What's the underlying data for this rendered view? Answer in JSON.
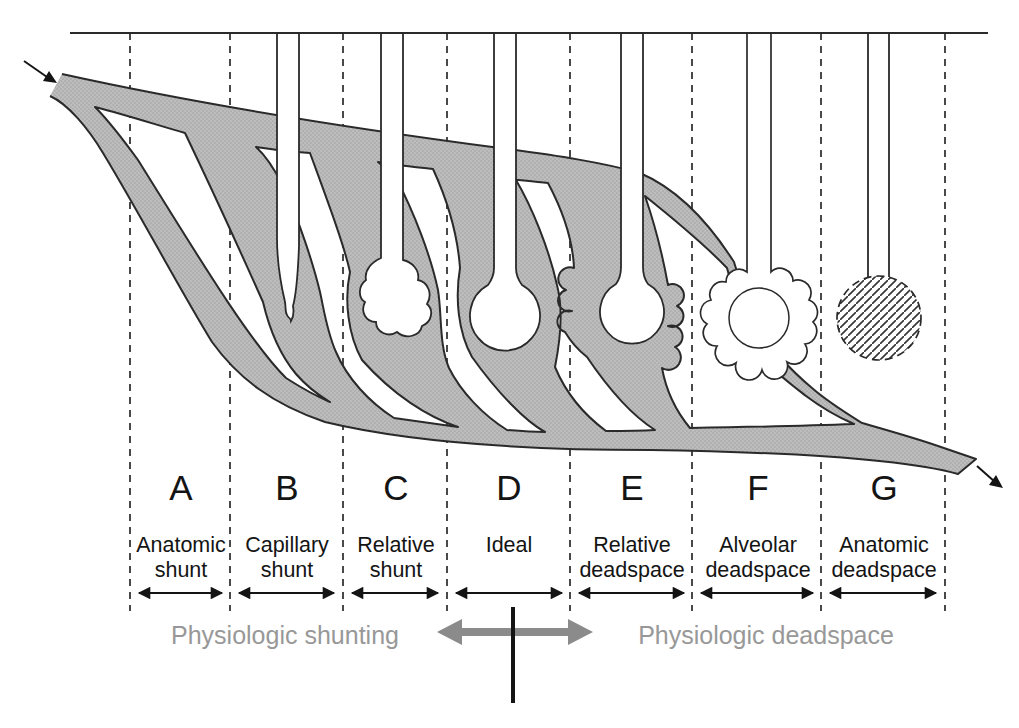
{
  "figure": {
    "title_hint": "ventilation-perfusion spectrum diagram",
    "zones": [
      {
        "letter": "A",
        "label_line1": "Anatomic",
        "label_line2": "shunt"
      },
      {
        "letter": "B",
        "label_line1": "Capillary",
        "label_line2": "shunt"
      },
      {
        "letter": "C",
        "label_line1": "Relative",
        "label_line2": "shunt"
      },
      {
        "letter": "D",
        "label_line1": "Ideal",
        "label_line2": ""
      },
      {
        "letter": "E",
        "label_line1": "Relative",
        "label_line2": "deadspace"
      },
      {
        "letter": "F",
        "label_line1": "Alveolar",
        "label_line2": "deadspace"
      },
      {
        "letter": "G",
        "label_line1": "Anatomic",
        "label_line2": "deadspace"
      }
    ],
    "group_labels": {
      "left": "Physiologic shunting",
      "right": "Physiologic deadspace"
    },
    "colors": {
      "vessel_fill": "#bdbdbd",
      "vessel_dot": "#a4a4a4",
      "outline": "#2a2a2a",
      "ink": "#141414",
      "muted_text": "#989898",
      "gray_arrow": "#8b8b8b",
      "hatch_line": "#333333"
    }
  }
}
